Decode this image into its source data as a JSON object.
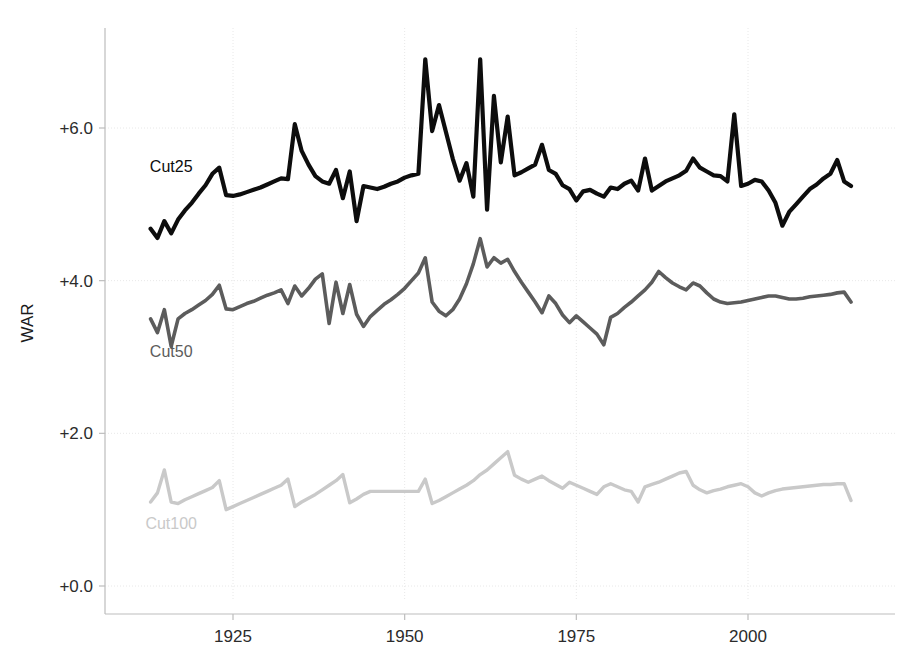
{
  "chart_data": {
    "type": "line",
    "title": "",
    "subtitle": "",
    "xlabel": "",
    "ylabel": "WAR",
    "xlim": [
      1911,
      2016
    ],
    "ylim": [
      0.0,
      7.3
    ],
    "grid": true,
    "legend_position": "inline-annotations",
    "x_ticks": [
      1925,
      1950,
      1975,
      2000
    ],
    "x_tick_labels": [
      "1925",
      "1950",
      "1975",
      "2000"
    ],
    "y_ticks": [
      0.0,
      2.0,
      4.0,
      6.0
    ],
    "y_tick_labels": [
      "+0.0",
      "+2.0",
      "+4.0",
      "+6.0"
    ],
    "x": [
      1913,
      1914,
      1915,
      1916,
      1917,
      1918,
      1919,
      1920,
      1921,
      1922,
      1923,
      1924,
      1925,
      1926,
      1927,
      1928,
      1929,
      1930,
      1931,
      1932,
      1933,
      1934,
      1935,
      1936,
      1937,
      1938,
      1939,
      1940,
      1941,
      1942,
      1943,
      1944,
      1945,
      1946,
      1947,
      1948,
      1949,
      1950,
      1951,
      1952,
      1953,
      1954,
      1955,
      1956,
      1957,
      1958,
      1959,
      1960,
      1961,
      1962,
      1963,
      1964,
      1965,
      1966,
      1967,
      1968,
      1969,
      1970,
      1971,
      1972,
      1973,
      1974,
      1975,
      1976,
      1977,
      1978,
      1979,
      1980,
      1981,
      1982,
      1983,
      1984,
      1985,
      1986,
      1987,
      1988,
      1989,
      1990,
      1991,
      1992,
      1993,
      1994,
      1995,
      1996,
      1997,
      1998,
      1999,
      2000,
      2001,
      2002,
      2003,
      2004,
      2005,
      2006,
      2007,
      2008,
      2009,
      2010,
      2011,
      2012,
      2013,
      2014,
      2015
    ],
    "series": [
      {
        "name": "Cut25",
        "color": "#0d0d0d",
        "label_x": 1916,
        "label_y": 5.42,
        "values": [
          4.68,
          4.56,
          4.78,
          4.62,
          4.8,
          4.92,
          5.02,
          5.14,
          5.25,
          5.4,
          5.48,
          5.12,
          5.11,
          5.13,
          5.16,
          5.19,
          5.22,
          5.26,
          5.3,
          5.34,
          5.33,
          6.05,
          5.7,
          5.52,
          5.37,
          5.3,
          5.27,
          5.45,
          5.08,
          5.43,
          4.78,
          5.24,
          5.22,
          5.2,
          5.23,
          5.27,
          5.3,
          5.35,
          5.38,
          5.4,
          6.9,
          5.96,
          6.3,
          5.95,
          5.6,
          5.31,
          5.54,
          5.1,
          6.9,
          4.93,
          6.42,
          5.55,
          6.15,
          5.38,
          5.42,
          5.47,
          5.52,
          5.78,
          5.45,
          5.4,
          5.25,
          5.2,
          5.05,
          5.17,
          5.19,
          5.14,
          5.1,
          5.22,
          5.2,
          5.27,
          5.31,
          5.18,
          5.6,
          5.18,
          5.24,
          5.3,
          5.34,
          5.38,
          5.44,
          5.6,
          5.48,
          5.43,
          5.38,
          5.37,
          5.3,
          6.18,
          5.24,
          5.27,
          5.32,
          5.3,
          5.18,
          5.02,
          4.72,
          4.9,
          5.0,
          5.1,
          5.2,
          5.26,
          5.34,
          5.4,
          5.58,
          5.3,
          5.24
        ]
      },
      {
        "name": "Cut50",
        "color": "#5c5c5c",
        "label_x": 1916,
        "label_y": 3.0,
        "values": [
          3.5,
          3.32,
          3.62,
          3.14,
          3.5,
          3.57,
          3.62,
          3.68,
          3.74,
          3.82,
          3.94,
          3.63,
          3.62,
          3.66,
          3.7,
          3.73,
          3.77,
          3.81,
          3.84,
          3.88,
          3.7,
          3.93,
          3.8,
          3.9,
          4.02,
          4.09,
          3.44,
          3.98,
          3.57,
          3.95,
          3.56,
          3.4,
          3.53,
          3.61,
          3.69,
          3.75,
          3.82,
          3.9,
          4.0,
          4.1,
          4.3,
          3.72,
          3.6,
          3.54,
          3.62,
          3.76,
          3.96,
          4.22,
          4.55,
          4.18,
          4.3,
          4.23,
          4.28,
          4.12,
          3.98,
          3.85,
          3.72,
          3.58,
          3.8,
          3.7,
          3.55,
          3.45,
          3.54,
          3.46,
          3.38,
          3.3,
          3.16,
          3.52,
          3.57,
          3.65,
          3.72,
          3.8,
          3.88,
          3.98,
          4.12,
          4.04,
          3.97,
          3.92,
          3.88,
          3.97,
          3.93,
          3.84,
          3.76,
          3.72,
          3.7,
          3.71,
          3.72,
          3.74,
          3.76,
          3.78,
          3.8,
          3.8,
          3.78,
          3.76,
          3.76,
          3.77,
          3.79,
          3.8,
          3.81,
          3.82,
          3.84,
          3.85,
          3.72
        ]
      },
      {
        "name": "Cut100",
        "color": "#c9c9c9",
        "label_x": 1916,
        "label_y": 0.75,
        "values": [
          1.1,
          1.22,
          1.52,
          1.1,
          1.08,
          1.13,
          1.17,
          1.21,
          1.25,
          1.29,
          1.38,
          1.0,
          1.04,
          1.08,
          1.12,
          1.16,
          1.2,
          1.24,
          1.28,
          1.32,
          1.4,
          1.04,
          1.1,
          1.15,
          1.2,
          1.26,
          1.32,
          1.38,
          1.46,
          1.09,
          1.14,
          1.2,
          1.24,
          1.24,
          1.24,
          1.24,
          1.24,
          1.24,
          1.24,
          1.24,
          1.4,
          1.08,
          1.12,
          1.17,
          1.22,
          1.27,
          1.32,
          1.38,
          1.46,
          1.52,
          1.6,
          1.68,
          1.76,
          1.45,
          1.4,
          1.36,
          1.4,
          1.44,
          1.38,
          1.33,
          1.28,
          1.36,
          1.32,
          1.28,
          1.24,
          1.2,
          1.3,
          1.34,
          1.3,
          1.26,
          1.24,
          1.1,
          1.3,
          1.33,
          1.36,
          1.4,
          1.44,
          1.48,
          1.5,
          1.32,
          1.26,
          1.22,
          1.25,
          1.27,
          1.3,
          1.32,
          1.34,
          1.3,
          1.22,
          1.18,
          1.22,
          1.25,
          1.27,
          1.28,
          1.29,
          1.3,
          1.31,
          1.32,
          1.33,
          1.33,
          1.34,
          1.34,
          1.12
        ]
      }
    ]
  },
  "axes": {
    "ylabel": "WAR",
    "y_tick_labels": [
      "+6.0",
      "+4.0",
      "+2.0",
      "+0.0"
    ],
    "x_tick_labels": [
      "1925",
      "1950",
      "1975",
      "2000"
    ]
  },
  "annotations": {
    "cut25": "Cut25",
    "cut50": "Cut50",
    "cut100": "Cut100"
  },
  "colors": {
    "cut25": "#0d0d0d",
    "cut50": "#5c5c5c",
    "cut100": "#c9c9c9",
    "grid": "#e8e8e8",
    "axis": "#bdbdbd",
    "text": "#2b2b2b",
    "background": "#ffffff"
  }
}
